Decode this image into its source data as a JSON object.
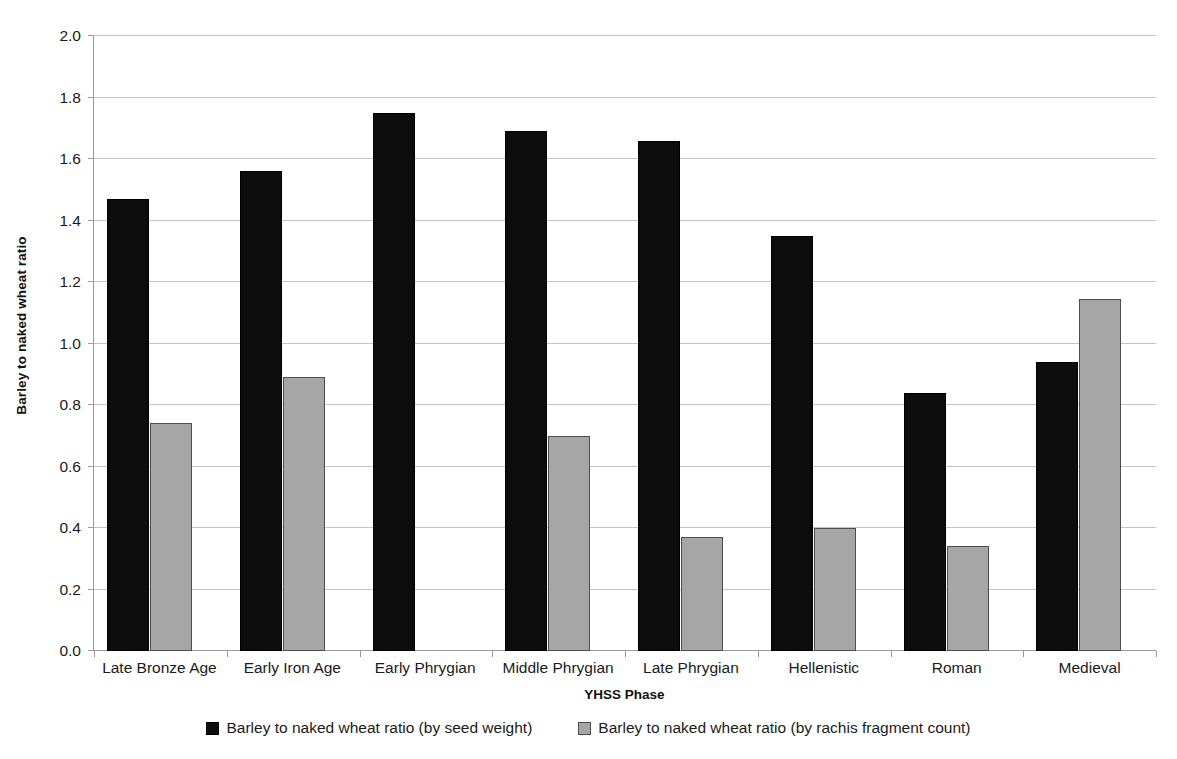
{
  "chart_data": {
    "type": "bar",
    "title": "",
    "xlabel": "YHSS Phase",
    "ylabel": "Barley to naked wheat ratio",
    "ylim": [
      0.0,
      2.0
    ],
    "ytick_step": 0.2,
    "grid": true,
    "legend_position": "bottom",
    "categories": [
      "Late Bronze Age",
      "Early Iron Age",
      "Early Phrygian",
      "Middle Phrygian",
      "Late Phrygian",
      "Hellenistic",
      "Roman",
      "Medieval"
    ],
    "ytick_labels": [
      "0.0",
      "0.2",
      "0.4",
      "0.6",
      "0.8",
      "1.0",
      "1.2",
      "1.4",
      "1.6",
      "1.8",
      "2.0"
    ],
    "ytick_values": [
      0.0,
      0.2,
      0.4,
      0.6,
      0.8,
      1.0,
      1.2,
      1.4,
      1.6,
      1.8,
      2.0
    ],
    "series": [
      {
        "name": "Barley to naked wheat ratio (by seed weight)",
        "color": "#0d0d0d",
        "values": [
          1.47,
          1.56,
          1.75,
          1.69,
          1.66,
          1.35,
          0.84,
          0.94
        ]
      },
      {
        "name": "Barley to naked wheat ratio (by rachis fragment count)",
        "color": "#a6a6a6",
        "values": [
          0.74,
          0.89,
          0.0,
          0.7,
          0.37,
          0.4,
          0.34,
          1.145
        ]
      }
    ]
  }
}
